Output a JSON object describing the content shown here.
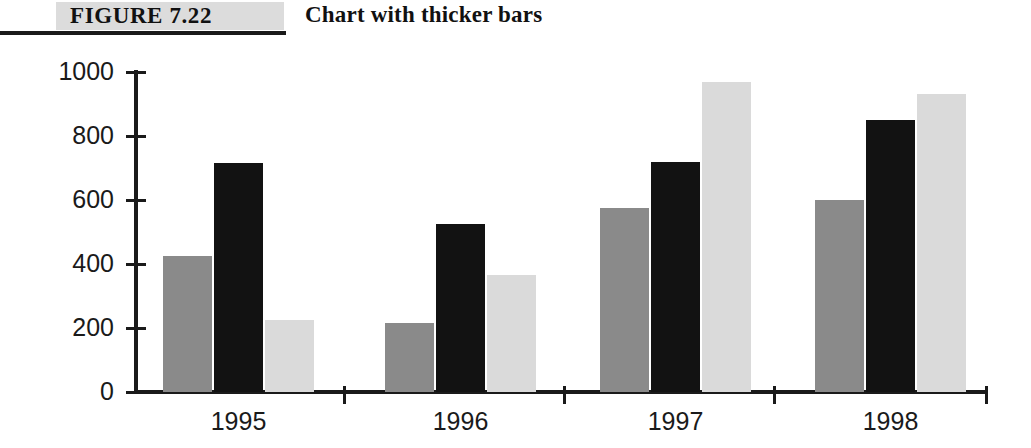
{
  "figure": {
    "label": "FIGURE 7.22",
    "title": "Chart with thicker bars"
  },
  "chart_data": {
    "type": "bar",
    "title": "Chart with thicker bars",
    "xlabel": "",
    "ylabel": "",
    "ylim": [
      0,
      1000
    ],
    "yticks": [
      0,
      200,
      400,
      600,
      800,
      1000
    ],
    "ytick_labels": [
      "0",
      "200",
      "400",
      "600",
      "800",
      "1000"
    ],
    "grid": false,
    "legend": "none",
    "categories": [
      "1995",
      "1996",
      "1997",
      "1998"
    ],
    "series": [
      {
        "name": "Series 1",
        "color": "#8a8a8a",
        "values": [
          425,
          215,
          575,
          600
        ]
      },
      {
        "name": "Series 2",
        "color": "#121212",
        "values": [
          715,
          525,
          720,
          850
        ]
      },
      {
        "name": "Series 3",
        "color": "#dadada",
        "values": [
          225,
          365,
          970,
          930
        ]
      }
    ]
  }
}
